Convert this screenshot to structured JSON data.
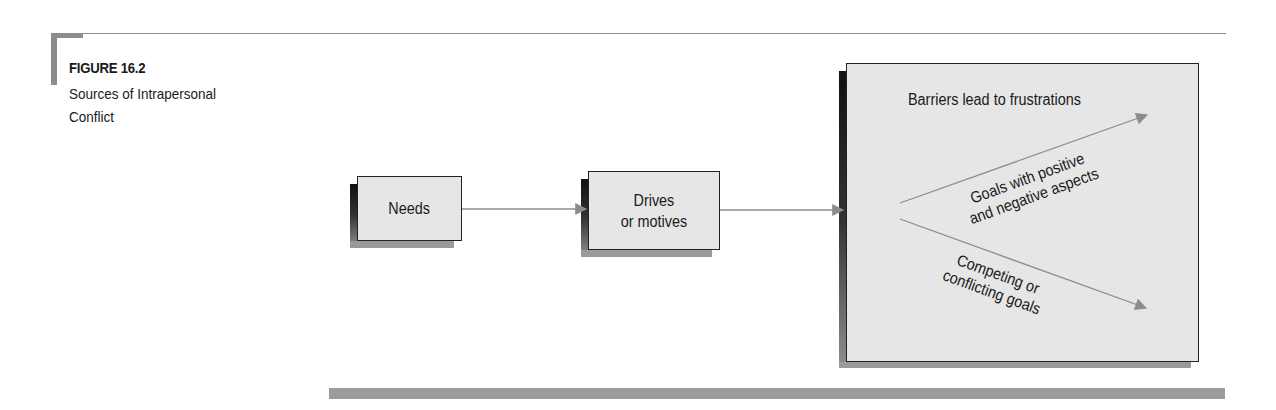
{
  "figure": {
    "number": "FIGURE 16.2",
    "caption_line1": "Sources of Intrapersonal",
    "caption_line2": "Conflict"
  },
  "diagram": {
    "title": "Sources of Intrapersonal Conflict",
    "nodes": [
      {
        "id": "needs",
        "label": "Needs"
      },
      {
        "id": "drives",
        "label_line1": "Drives",
        "label_line2": "or motives"
      },
      {
        "id": "outcomes",
        "label": ""
      }
    ],
    "edges": [
      {
        "from": "needs",
        "to": "drives"
      },
      {
        "from": "drives",
        "to": "outcomes"
      }
    ],
    "outcome_labels": {
      "barriers": "Barriers lead to frustrations",
      "goals_mixed_line1": "Goals with positive",
      "goals_mixed_line2": "and negative aspects",
      "competing_line1": "Competing or",
      "competing_line2": "conflicting goals"
    }
  },
  "colors": {
    "box_fill": "#e6e6e6",
    "arrow": "#8c8c8c",
    "rule": "#8a8a8a"
  }
}
